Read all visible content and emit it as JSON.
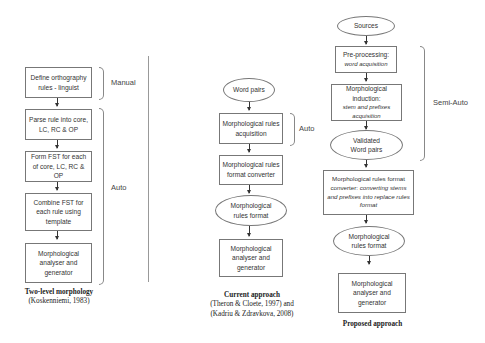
{
  "left": {
    "steps": [
      "Define orthography rules - linguist",
      "Parse rule into core, LC, RC & OP",
      "Form FST for each of core, LC, RC & OP",
      "Combine FST for each rule using template",
      "Morphological analyser and generator"
    ],
    "brace_manual": "Manual",
    "brace_auto": "Auto",
    "caption_title": "Two-level morphology",
    "caption_ref": "(Koskenniemi, 1983)"
  },
  "middle": {
    "input": "Word pairs",
    "steps": [
      "Morphological rules acquisition",
      "Morphological rules format converter",
      "Morphological rules format",
      "Morphological analyser and generator"
    ],
    "brace_auto": "Auto",
    "caption_title": "Current approach",
    "caption_ref1": "(Theron & Cloete, 1997) and",
    "caption_ref2": "(Kadriu & Zdravkova, 2008)"
  },
  "right": {
    "source": "Sources",
    "preproc_title": "Pre-processing:",
    "preproc_sub": "word acquisition",
    "induction_title": "Morphological induction:",
    "induction_sub": "stem and prefixes acquisition",
    "validated": "Validated Word pairs",
    "converter_title": "Morphological rules format converter:",
    "converter_sub": "converting stems and prefixes into replace rules format",
    "format": "Morphological rules format",
    "analyser": "Morphological analyser and generator",
    "brace_semi": "Semi-Auto",
    "caption_title": "Proposed approach"
  }
}
